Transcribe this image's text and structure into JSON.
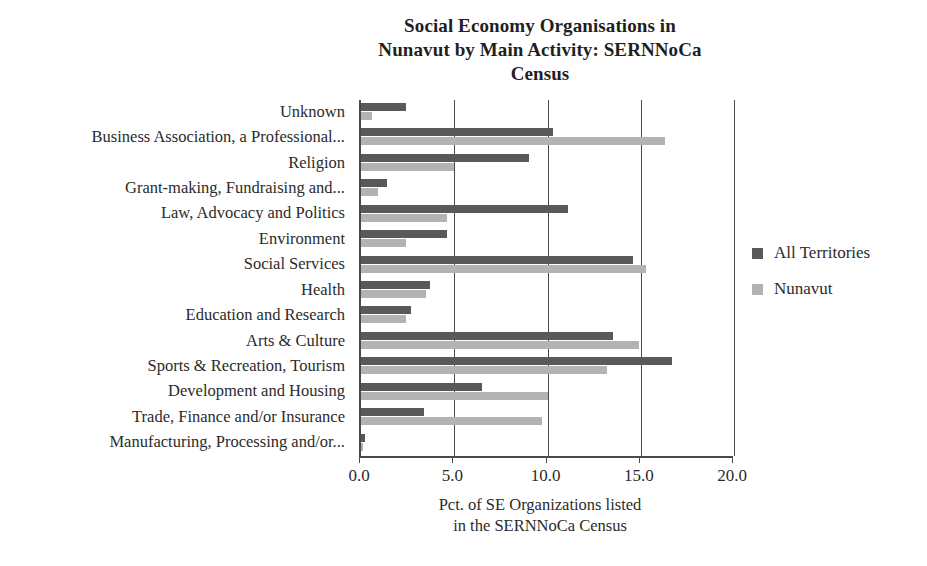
{
  "chart_data": {
    "type": "bar",
    "orientation": "horizontal",
    "title": "Social Economy Organisations in Nunavut by Main Activity: SERNNoCa Census",
    "title_lines": [
      "Social Economy Organisations in",
      "Nunavut by Main Activity: SERNNoCa",
      "Census"
    ],
    "xlabel": "Pct. of SE Organizations listed in the SERNNoCa Census",
    "xlabel_lines": [
      "Pct. of SE Organizations listed",
      "in the SERNNoCa Census"
    ],
    "ylabel": "",
    "xlim": [
      0.0,
      20.0
    ],
    "xticks": [
      0.0,
      5.0,
      10.0,
      15.0,
      20.0
    ],
    "xticklabels": [
      "0.0",
      "5.0",
      "10.0",
      "15.0",
      "20.0"
    ],
    "grid": true,
    "grid_axis": "x",
    "legend_position": "right",
    "categories": [
      "Unknown",
      "Business Association, a Professional...",
      "Religion",
      "Grant-making, Fundraising and...",
      "Law, Advocacy and Politics",
      "Environment",
      "Social Services",
      "Health",
      "Education and Research",
      "Arts & Culture",
      "Sports & Recreation, Tourism",
      "Development and Housing",
      "Trade, Finance and/or Insurance",
      "Manufacturing, Processing and/or..."
    ],
    "series": [
      {
        "name": "All Territories",
        "color": "#595959",
        "values": [
          2.4,
          10.3,
          9.0,
          1.4,
          11.1,
          4.6,
          14.6,
          3.7,
          2.7,
          13.5,
          16.7,
          6.5,
          3.4,
          0.2
        ]
      },
      {
        "name": "Nunavut",
        "color": "#b3b3b3",
        "values": [
          0.6,
          16.3,
          5.0,
          0.9,
          4.6,
          2.4,
          15.3,
          3.5,
          2.4,
          14.9,
          13.2,
          10.0,
          9.7,
          0.1
        ]
      }
    ]
  }
}
